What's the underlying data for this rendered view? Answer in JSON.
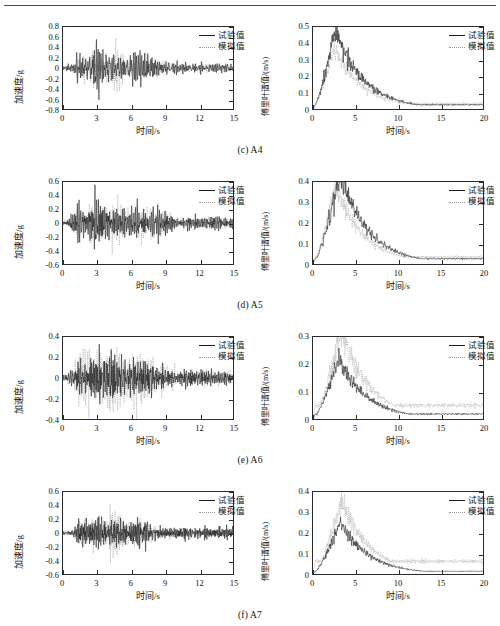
{
  "figure": {
    "series_names": {
      "experimental": "试验值",
      "simulated": "模拟值"
    },
    "colors": {
      "experimental": "#1a1a1a",
      "simulated": "#9a9a9a",
      "axis": "#2b2b2b",
      "background": "#ffffff"
    },
    "rows": [
      {
        "caption": "(c) A4",
        "left": {
          "xlabel": "时间/s",
          "ylabel": "加速度/g",
          "xticks": [
            "0",
            "3",
            "6",
            "9",
            "12",
            "15"
          ],
          "yticks": [
            "0.8",
            "0.6",
            "0.4",
            "0.2",
            "0",
            "-0.2",
            "-0.4",
            "-0.6",
            "-0.8"
          ]
        },
        "right": {
          "xlabel": "时间/s",
          "ylabel": "傅里叶谱值/(m/s)",
          "xticks": [
            "0",
            "5",
            "10",
            "15",
            "20"
          ],
          "yticks": [
            "0.5",
            "0.4",
            "0.3",
            "0.2",
            "0.1",
            "0"
          ]
        }
      },
      {
        "caption": "(d) A5",
        "left": {
          "xlabel": "时间/s",
          "ylabel": "加速度/g",
          "xticks": [
            "0",
            "3",
            "6",
            "9",
            "12",
            "15"
          ],
          "yticks": [
            "0.6",
            "0.4",
            "0.2",
            "0",
            "-0.2",
            "-0.4",
            "-0.6"
          ]
        },
        "right": {
          "xlabel": "时间/s",
          "ylabel": "傅里叶谱值/(m/s)",
          "xticks": [
            "0",
            "5",
            "10",
            "15",
            "20"
          ],
          "yticks": [
            "0.4",
            "0.3",
            "0.2",
            "0.1",
            "0"
          ]
        }
      },
      {
        "caption": "(e) A6",
        "left": {
          "xlabel": "时间/s",
          "ylabel": "加速度/g",
          "xticks": [
            "0",
            "3",
            "6",
            "9",
            "12",
            "15"
          ],
          "yticks": [
            "0.4",
            "0.2",
            "0",
            "-0.2",
            "-0.4"
          ]
        },
        "right": {
          "xlabel": "时间/s",
          "ylabel": "傅里叶谱值/(m/s)",
          "xticks": [
            "0",
            "5",
            "10",
            "15",
            "20"
          ],
          "yticks": [
            "0.3",
            "0.2",
            "0.1",
            "0"
          ]
        }
      },
      {
        "caption": "(f) A7",
        "left": {
          "xlabel": "时间/s",
          "ylabel": "加速度/g",
          "xticks": [
            "0",
            "3",
            "6",
            "9",
            "12",
            "15"
          ],
          "yticks": [
            "0.6",
            "0.4",
            "0.2",
            "0",
            "-0.2",
            "-0.4",
            "-0.6"
          ]
        },
        "right": {
          "xlabel": "时间/s",
          "ylabel": "傅里叶谱值/(m/s)",
          "xticks": [
            "0",
            "5",
            "10",
            "15",
            "20"
          ],
          "yticks": [
            "0.4",
            "0.3",
            "0.2",
            "0.1",
            "0"
          ]
        }
      }
    ]
  },
  "chart_data": [
    {
      "id": "c-A4-timehistory",
      "type": "line",
      "title": "(c) A4 acceleration time history",
      "xlabel": "时间/s",
      "ylabel": "加速度/g",
      "xlim": [
        0,
        15
      ],
      "ylim": [
        -0.8,
        0.8
      ],
      "xticks": [
        0,
        3,
        6,
        9,
        12,
        15
      ],
      "yticks": [
        -0.8,
        -0.6,
        -0.4,
        -0.2,
        0,
        0.2,
        0.4,
        0.6,
        0.8
      ],
      "grid": false,
      "legend_position": "top-right",
      "series": [
        {
          "name": "试验值",
          "style": "solid",
          "color": "#1a1a1a",
          "envelope_peak": 0.62,
          "peak_time": 3.1,
          "strong_motion_window": [
            1.5,
            7.2
          ],
          "rms_late": 0.09,
          "dominant_period_s": 0.33
        },
        {
          "name": "模拟值",
          "style": "dotted",
          "color": "#9a9a9a",
          "envelope_peak": 0.58,
          "peak_time": 4.6,
          "strong_motion_window": [
            1.4,
            7.5
          ],
          "rms_late": 0.07,
          "dominant_period_s": 0.33
        }
      ]
    },
    {
      "id": "c-A4-fourier",
      "type": "line",
      "title": "(c) A4 Fourier spectrum",
      "xlabel": "时间/s",
      "ylabel": "傅里叶谱值/(m/s)",
      "xlim": [
        0,
        20
      ],
      "ylim": [
        0,
        0.5
      ],
      "xticks": [
        0,
        5,
        10,
        15,
        20
      ],
      "yticks": [
        0,
        0.1,
        0.2,
        0.3,
        0.4,
        0.5
      ],
      "grid": false,
      "legend_position": "top-right",
      "series": [
        {
          "name": "试验值",
          "style": "solid",
          "color": "#1a1a1a",
          "peak_value": 0.43,
          "peak_x": 2.6,
          "tail_value_at_15": 0.02
        },
        {
          "name": "模拟值",
          "style": "dotted",
          "color": "#9a9a9a",
          "peak_value": 0.31,
          "peak_x": 2.5,
          "tail_value_at_15": 0.025
        }
      ]
    },
    {
      "id": "d-A5-timehistory",
      "type": "line",
      "title": "(d) A5 acceleration time history",
      "xlabel": "时间/s",
      "ylabel": "加速度/g",
      "xlim": [
        0,
        15
      ],
      "ylim": [
        -0.6,
        0.6
      ],
      "xticks": [
        0,
        3,
        6,
        9,
        12,
        15
      ],
      "yticks": [
        -0.6,
        -0.4,
        -0.2,
        0,
        0.2,
        0.4,
        0.6
      ],
      "grid": false,
      "legend_position": "top-right",
      "series": [
        {
          "name": "试验值",
          "style": "solid",
          "color": "#1a1a1a",
          "envelope_peak": 0.56,
          "peak_time": 3.0,
          "strong_motion_window": [
            1.2,
            8.0
          ],
          "rms_late": 0.1,
          "dominant_period_s": 0.3
        },
        {
          "name": "模拟值",
          "style": "dotted",
          "color": "#9a9a9a",
          "envelope_peak": 0.47,
          "peak_time": 4.5,
          "strong_motion_window": [
            1.2,
            8.0
          ],
          "rms_late": 0.08,
          "dominant_period_s": 0.3
        }
      ]
    },
    {
      "id": "d-A5-fourier",
      "type": "line",
      "title": "(d) A5 Fourier spectrum",
      "xlabel": "时间/s",
      "ylabel": "傅里叶谱值/(m/s)",
      "xlim": [
        0,
        20
      ],
      "ylim": [
        0,
        0.4
      ],
      "xticks": [
        0,
        5,
        10,
        15,
        20
      ],
      "yticks": [
        0,
        0.1,
        0.2,
        0.3,
        0.4
      ],
      "grid": false,
      "legend_position": "top-right",
      "series": [
        {
          "name": "试验值",
          "style": "solid",
          "color": "#1a1a1a",
          "peak_value": 0.39,
          "peak_x": 3.2,
          "tail_value_at_15": 0.02
        },
        {
          "name": "模拟值",
          "style": "dotted",
          "color": "#9a9a9a",
          "peak_value": 0.32,
          "peak_x": 2.6,
          "tail_value_at_15": 0.025
        }
      ]
    },
    {
      "id": "e-A6-timehistory",
      "type": "line",
      "title": "(e) A6 acceleration time history",
      "xlabel": "时间/s",
      "ylabel": "加速度/g",
      "xlim": [
        0,
        15
      ],
      "ylim": [
        -0.4,
        0.4
      ],
      "xticks": [
        0,
        3,
        6,
        9,
        12,
        15
      ],
      "yticks": [
        -0.4,
        -0.2,
        0,
        0.2,
        0.4
      ],
      "grid": false,
      "legend_position": "top-right",
      "series": [
        {
          "name": "试验值",
          "style": "solid",
          "color": "#1a1a1a",
          "envelope_peak": 0.33,
          "peak_time": 3.0,
          "strong_motion_window": [
            1.3,
            7.5
          ],
          "rms_late": 0.07,
          "dominant_period_s": 0.28
        },
        {
          "name": "模拟值",
          "style": "dotted",
          "color": "#9a9a9a",
          "envelope_peak": 0.4,
          "peak_time": 4.4,
          "strong_motion_window": [
            1.4,
            7.0
          ],
          "rms_late": 0.05,
          "dominant_period_s": 0.28
        }
      ]
    },
    {
      "id": "e-A6-fourier",
      "type": "line",
      "title": "(e) A6 Fourier spectrum",
      "xlabel": "时间/s",
      "ylabel": "傅里叶谱值/(m/s)",
      "xlim": [
        0,
        20
      ],
      "ylim": [
        0,
        0.3
      ],
      "xticks": [
        0,
        5,
        10,
        15,
        20
      ],
      "yticks": [
        0,
        0.1,
        0.2,
        0.3
      ],
      "grid": false,
      "legend_position": "top-right",
      "series": [
        {
          "name": "试验值",
          "style": "solid",
          "color": "#1a1a1a",
          "peak_value": 0.21,
          "peak_x": 3.0,
          "tail_value_at_15": 0.015
        },
        {
          "name": "模拟值",
          "style": "dotted",
          "color": "#9a9a9a",
          "peak_value": 0.3,
          "peak_x": 3.3,
          "tail_value_at_15": 0.04
        }
      ]
    },
    {
      "id": "f-A7-timehistory",
      "type": "line",
      "title": "(f) A7 acceleration time history",
      "xlabel": "时间/s",
      "ylabel": "加速度/g",
      "xlim": [
        0,
        15
      ],
      "ylim": [
        -0.6,
        0.6
      ],
      "xticks": [
        0,
        3,
        6,
        9,
        12,
        15
      ],
      "yticks": [
        -0.6,
        -0.4,
        -0.2,
        0,
        0.2,
        0.4,
        0.6
      ],
      "grid": false,
      "legend_position": "top-right",
      "series": [
        {
          "name": "试验值",
          "style": "solid",
          "color": "#1a1a1a",
          "envelope_peak": 0.27,
          "peak_time": 3.1,
          "strong_motion_window": [
            1.4,
            7.2
          ],
          "rms_late": 0.06,
          "dominant_period_s": 0.27
        },
        {
          "name": "模拟值",
          "style": "dotted",
          "color": "#9a9a9a",
          "envelope_peak": 0.44,
          "peak_time": 4.5,
          "strong_motion_window": [
            1.5,
            7.0
          ],
          "rms_late": 0.05,
          "dominant_period_s": 0.27
        }
      ]
    },
    {
      "id": "f-A7-fourier",
      "type": "line",
      "title": "(f) A7 Fourier spectrum",
      "xlabel": "时间/s",
      "ylabel": "傅里叶谱值/(m/s)",
      "xlim": [
        0,
        20
      ],
      "ylim": [
        0,
        0.4
      ],
      "xticks": [
        0,
        5,
        10,
        15,
        20
      ],
      "yticks": [
        0,
        0.1,
        0.2,
        0.3,
        0.4
      ],
      "grid": false,
      "legend_position": "top-right",
      "series": [
        {
          "name": "试验值",
          "style": "solid",
          "color": "#1a1a1a",
          "peak_value": 0.22,
          "peak_x": 3.2,
          "tail_value_at_15": 0.01
        },
        {
          "name": "模拟值",
          "style": "dotted",
          "color": "#9a9a9a",
          "peak_value": 0.33,
          "peak_x": 3.4,
          "tail_value_at_15": 0.05
        }
      ]
    }
  ]
}
